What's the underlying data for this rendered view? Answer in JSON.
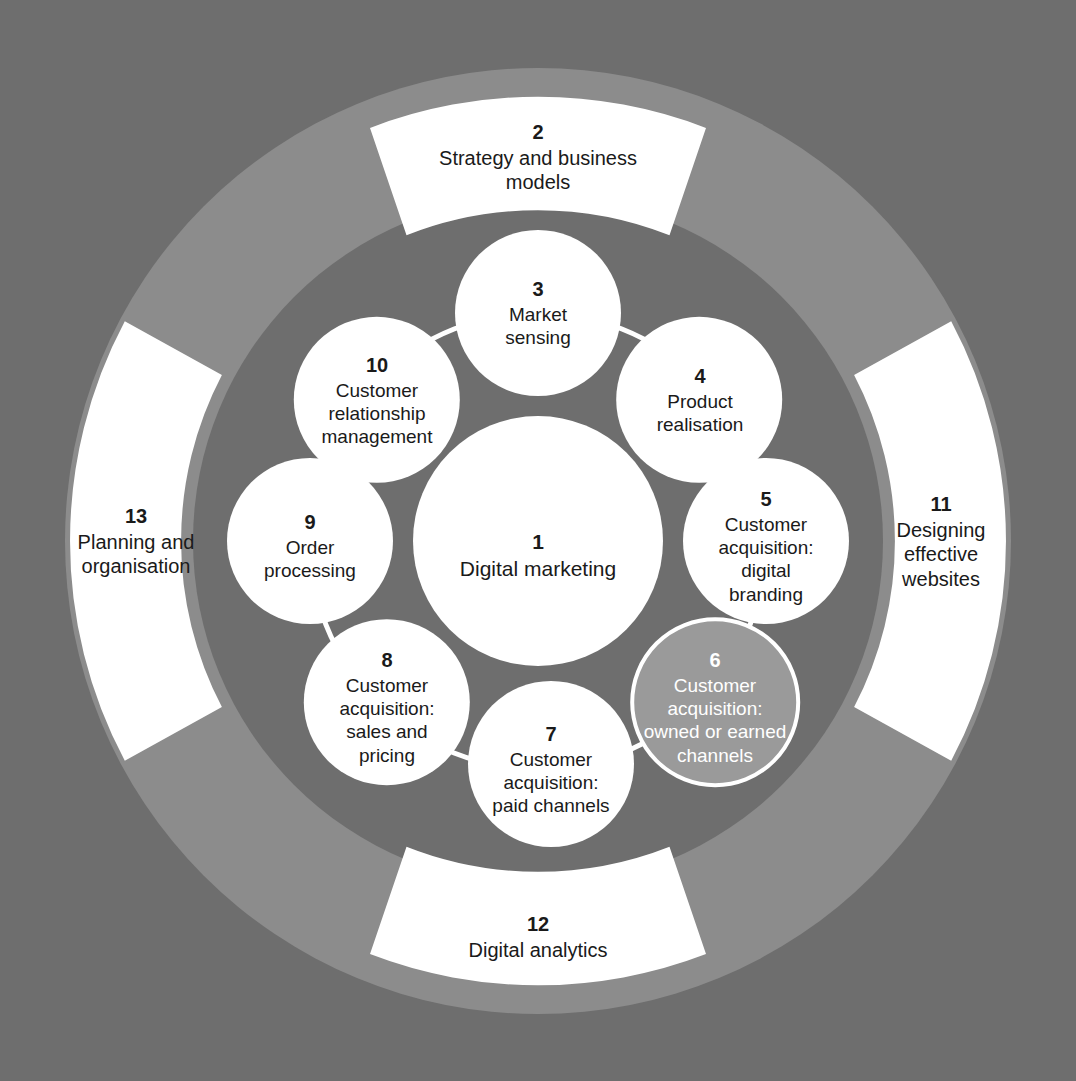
{
  "diagram": {
    "background_color": "#6e6e6e",
    "outer_ring_color": "#8c8c8c",
    "inner_disc_color": "#6e6e6e",
    "segment_fill_color": "#ffffff",
    "node_fill_color": "#ffffff",
    "highlight_fill_color": "#9a9a9a",
    "text_color": "#1a1a1a",
    "highlight_text_color": "#ffffff"
  },
  "center": {
    "number": "1",
    "label": "Digital marketing"
  },
  "inner_nodes": [
    {
      "number": "3",
      "label": "Market\nsensing"
    },
    {
      "number": "4",
      "label": "Product\nrealisation"
    },
    {
      "number": "5",
      "label": "Customer\nacquisition:\ndigital\nbranding"
    },
    {
      "number": "6",
      "label": "Customer\nacquisition:\nowned or earned\nchannels",
      "highlighted": true
    },
    {
      "number": "7",
      "label": "Customer\nacquisition:\npaid channels"
    },
    {
      "number": "8",
      "label": "Customer\nacquisition:\nsales and\npricing"
    },
    {
      "number": "9",
      "label": "Order\nprocessing"
    },
    {
      "number": "10",
      "label": "Customer\nrelationship\nmanagement"
    }
  ],
  "outer_segments": [
    {
      "number": "2",
      "label": "Strategy and business\nmodels",
      "position": "top"
    },
    {
      "number": "11",
      "label": "Designing\neffective\nwebsites",
      "position": "right"
    },
    {
      "number": "12",
      "label": "Digital analytics",
      "position": "bottom"
    },
    {
      "number": "13",
      "label": "Planning and\norganisation",
      "position": "left"
    }
  ]
}
